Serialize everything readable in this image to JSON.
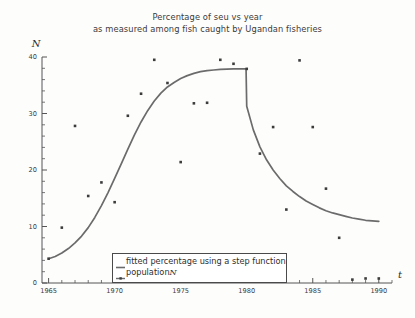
{
  "chart_data": {
    "type": "scatter",
    "title": "Percentage of seu vs year\nas measured among fish caught by Ugandan fisheries",
    "title_line1": "Percentage of seu vs year",
    "title_line2": "as measured among fish caught by Ugandan fisheries",
    "xlabel": "t",
    "ylabel": "N",
    "xlim": [
      1964.5,
      1991.0
    ],
    "ylim": [
      0,
      40
    ],
    "xticks": [
      1965,
      1970,
      1975,
      1980,
      1985,
      1990
    ],
    "xtick_labels": [
      "1965",
      "1970",
      "1975",
      "1980",
      "1985",
      "1990"
    ],
    "x_minor_step": 1,
    "yticks": [
      0,
      10,
      20,
      30,
      40
    ],
    "ytick_labels": [
      "0",
      "10",
      "20",
      "30",
      "40"
    ],
    "y_minor_step": 2,
    "grid": false,
    "legend_position": "lower-center",
    "series": [
      {
        "name": "population N",
        "label": "population",
        "label_italic": "N",
        "type": "scatter",
        "marker": "square",
        "color": "#3c3c3c",
        "x": [
          1965,
          1966,
          1967,
          1968,
          1969,
          1970,
          1971,
          1972,
          1973,
          1974,
          1975,
          1976,
          1977,
          1978,
          1979,
          1980,
          1981,
          1982,
          1983,
          1984,
          1985,
          1986,
          1987,
          1988,
          1989,
          1990
        ],
        "y": [
          4.3,
          9.8,
          27.8,
          15.4,
          17.8,
          14.3,
          29.6,
          33.5,
          39.5,
          35.4,
          21.4,
          31.8,
          31.9,
          39.5,
          38.8,
          37.9,
          22.9,
          27.6,
          13.0,
          39.4,
          27.6,
          16.7,
          8.0,
          0.6,
          0.8,
          0.8
        ]
      },
      {
        "name": "fitted percentage using a step function",
        "label": "fitted percentage using a step function",
        "type": "line",
        "color": "#6b6b6b",
        "x": [
          1965.0,
          1965.5,
          1966.0,
          1966.5,
          1967.0,
          1967.5,
          1968.0,
          1968.5,
          1969.0,
          1969.5,
          1970.0,
          1970.5,
          1971.0,
          1971.5,
          1972.0,
          1972.5,
          1973.0,
          1973.5,
          1974.0,
          1974.5,
          1975.0,
          1975.5,
          1976.0,
          1976.5,
          1977.0,
          1977.5,
          1978.0,
          1978.5,
          1979.0,
          1979.5,
          1979.95,
          1980.0,
          1980.5,
          1981.0,
          1981.5,
          1982.0,
          1982.5,
          1983.0,
          1983.5,
          1984.0,
          1984.5,
          1985.0,
          1985.5,
          1986.0,
          1986.5,
          1987.0,
          1987.5,
          1988.0,
          1988.5,
          1989.0,
          1989.5,
          1990.0
        ],
        "y": [
          4.3,
          4.7,
          5.3,
          6.1,
          7.1,
          8.3,
          9.8,
          11.6,
          13.7,
          16.0,
          18.5,
          21.1,
          23.7,
          26.2,
          28.5,
          30.5,
          32.2,
          33.6,
          34.7,
          35.5,
          36.2,
          36.7,
          37.1,
          37.4,
          37.6,
          37.7,
          37.8,
          37.85,
          37.9,
          37.9,
          37.9,
          31.3,
          27.1,
          24.1,
          21.8,
          20.0,
          18.5,
          17.2,
          16.2,
          15.3,
          14.5,
          13.9,
          13.3,
          12.8,
          12.4,
          12.1,
          11.8,
          11.5,
          11.3,
          11.1,
          11.0,
          10.9
        ]
      }
    ]
  },
  "legend": {
    "items": [
      {
        "label": "fitted percentage using a step function",
        "marker": "line"
      },
      {
        "label": "population",
        "italic_suffix": "N",
        "marker": "line-dot"
      }
    ]
  }
}
